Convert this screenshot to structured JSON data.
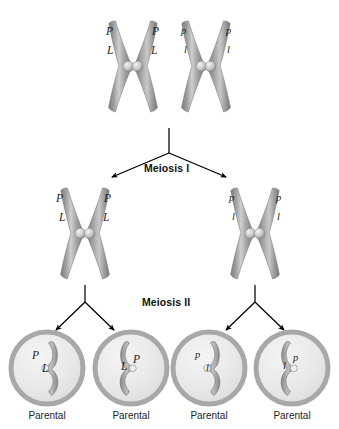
{
  "diagram": {
    "background_color": "#ffffff",
    "chromosome_color": "#9a9a9a",
    "chromosome_highlight": "#d6d6d6",
    "centromere_color": "#cfcfcf",
    "cell_ring_color": "#a8a8a8",
    "cell_fill_color": "#ececec",
    "arrow_color": "#000000"
  },
  "stages": {
    "meiosis_i": "Meiosis I",
    "meiosis_ii": "Meiosis II"
  },
  "top_row": {
    "chromosome_left": {
      "alleles": {
        "upper_left": "P",
        "upper_right": "P",
        "lower_left": "L",
        "lower_right": "L"
      }
    },
    "chromosome_right": {
      "alleles": {
        "upper_left": "p",
        "upper_right": "p",
        "lower_left": "l",
        "lower_right": "l"
      }
    }
  },
  "middle_row": {
    "chromosome_left": {
      "alleles": {
        "upper_left": "P",
        "upper_right": "P",
        "lower_left": "L",
        "lower_right": "L"
      }
    },
    "chromosome_right": {
      "alleles": {
        "upper_left": "p",
        "upper_right": "p",
        "lower_left": "l",
        "lower_right": "l"
      }
    }
  },
  "gametes": [
    {
      "id": "gamete-1",
      "allele_a": "P",
      "allele_b": "L",
      "caption": "Parental",
      "mirrored": false
    },
    {
      "id": "gamete-2",
      "allele_a": "L",
      "allele_b": "P",
      "caption": "Parental",
      "mirrored": true
    },
    {
      "id": "gamete-3",
      "allele_a": "p",
      "allele_b": "l",
      "caption": "Parental",
      "mirrored": false
    },
    {
      "id": "gamete-4",
      "allele_a": "l",
      "allele_b": "p",
      "caption": "Parental",
      "mirrored": true
    }
  ]
}
